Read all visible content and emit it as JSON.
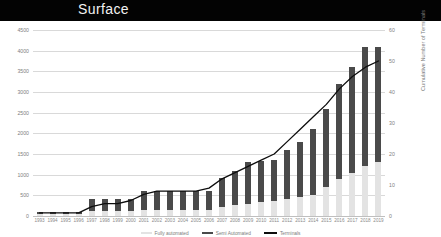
{
  "header": {
    "title": "Surface"
  },
  "legend": {
    "items": [
      {
        "label": "Fully automated",
        "swatch": "auto",
        "color": "#e3e3e3"
      },
      {
        "label": "Semi Automated",
        "swatch": "semi",
        "color": "#4a4a4a"
      },
      {
        "label": "Terminals",
        "swatch": "line",
        "color": "#0d0d0d"
      }
    ]
  },
  "chart_data": {
    "type": "bar",
    "title": "Surface",
    "xlabel": "",
    "ylabel": "Cumulative Terminal Surface (Ha)",
    "y2label": "Cumulative Number of Terminals",
    "ylim": [
      0,
      4500
    ],
    "y2lim": [
      0,
      60
    ],
    "yticks": [
      0,
      500,
      1000,
      1500,
      2000,
      2500,
      3000,
      3500,
      4000,
      4500
    ],
    "y2ticks": [
      0,
      10,
      20,
      30,
      40,
      50,
      60
    ],
    "grid": true,
    "legend_position": "bottom",
    "stacked": true,
    "categories": [
      "1993",
      "1994",
      "1995",
      "1996",
      "1997",
      "1998",
      "1999",
      "2000",
      "2001",
      "2002",
      "2003",
      "2004",
      "2005",
      "2006",
      "2007",
      "2008",
      "2009",
      "2010",
      "2011",
      "2012",
      "2013",
      "2014",
      "2015",
      "2016",
      "2017",
      "2018",
      "2019"
    ],
    "series": [
      {
        "name": "Fully automated",
        "axis": "left",
        "color": "#e3e3e3",
        "values": [
          60,
          60,
          60,
          60,
          120,
          120,
          120,
          120,
          150,
          150,
          150,
          150,
          150,
          150,
          220,
          260,
          300,
          330,
          360,
          420,
          470,
          520,
          700,
          900,
          1050,
          1200,
          1300
        ]
      },
      {
        "name": "Semi Automated",
        "axis": "left",
        "color": "#4a4a4a",
        "values": [
          40,
          40,
          40,
          40,
          280,
          280,
          280,
          280,
          450,
          450,
          450,
          450,
          450,
          450,
          700,
          820,
          1000,
          1000,
          1000,
          1180,
          1330,
          1580,
          1900,
          2300,
          2550,
          2900,
          2800
        ]
      },
      {
        "name": "Terminals",
        "axis": "right",
        "color": "#0d0d0d",
        "type": "line",
        "values": [
          1,
          1,
          1,
          1,
          3,
          4,
          4,
          5,
          7,
          8,
          8,
          8,
          8,
          9,
          12,
          14,
          16,
          18,
          20,
          24,
          28,
          32,
          36,
          41,
          45,
          48,
          50
        ]
      }
    ]
  }
}
